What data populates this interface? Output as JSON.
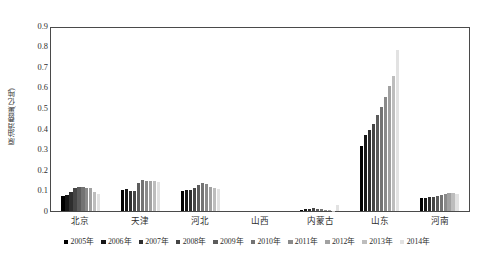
{
  "chart_data": {
    "type": "bar",
    "title": "",
    "xlabel": "",
    "ylabel": "原油消费量(亿吨)",
    "ylim": [
      0,
      0.9
    ],
    "ytick_labels": [
      "0.9",
      "0.8",
      "0.7",
      "0.6",
      "0.5",
      "0.4",
      "0.3",
      "0.2",
      "0.1",
      "0"
    ],
    "ytick_values": [
      0.9,
      0.8,
      0.7,
      0.6,
      0.5,
      0.4,
      0.3,
      0.2,
      0.1,
      0
    ],
    "grid": false,
    "legend_position": "bottom",
    "categories": [
      "北京",
      "天津",
      "河北",
      "山西",
      "内蒙古",
      "山东",
      "河南"
    ],
    "series": [
      {
        "name": "2005年",
        "color": "#000000",
        "values": [
          0.075,
          0.105,
          0.1,
          0.0,
          0.005,
          0.32,
          0.063
        ]
      },
      {
        "name": "2006年",
        "color": "#171717",
        "values": [
          0.08,
          0.108,
          0.103,
          0.0,
          0.008,
          0.375,
          0.066
        ]
      },
      {
        "name": "2007年",
        "color": "#2e2e2e",
        "values": [
          0.092,
          0.1,
          0.105,
          0.0,
          0.012,
          0.4,
          0.068
        ]
      },
      {
        "name": "2008年",
        "color": "#454545",
        "values": [
          0.113,
          0.098,
          0.112,
          0.0,
          0.013,
          0.43,
          0.07
        ]
      },
      {
        "name": "2009年",
        "color": "#5c5c5c",
        "values": [
          0.118,
          0.14,
          0.128,
          0.0,
          0.01,
          0.47,
          0.072
        ]
      },
      {
        "name": "2010年",
        "color": "#737373",
        "values": [
          0.118,
          0.152,
          0.138,
          0.0,
          0.009,
          0.51,
          0.08
        ]
      },
      {
        "name": "2011年",
        "color": "#8a8a8a",
        "values": [
          0.115,
          0.15,
          0.132,
          0.0,
          0.006,
          0.56,
          0.085
        ]
      },
      {
        "name": "2012年",
        "color": "#a1a1a1",
        "values": [
          0.112,
          0.15,
          0.12,
          0.0,
          0.004,
          0.615,
          0.088
        ]
      },
      {
        "name": "2013年",
        "color": "#bdbdbd",
        "values": [
          0.095,
          0.148,
          0.112,
          0.0,
          0.002,
          0.665,
          0.09
        ]
      },
      {
        "name": "2014年",
        "color": "#e2e2e2",
        "values": [
          0.085,
          0.145,
          0.11,
          0.0,
          0.028,
          0.79,
          0.082
        ]
      }
    ]
  }
}
